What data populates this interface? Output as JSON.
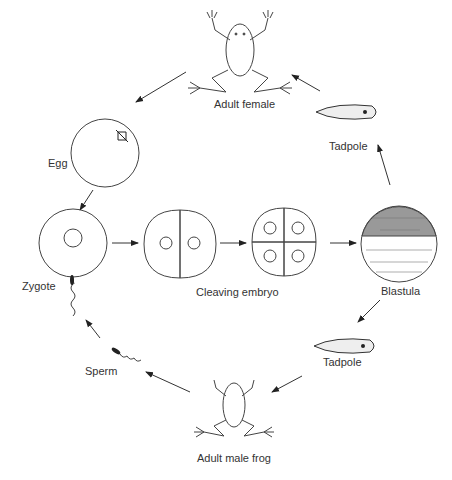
{
  "diagram": {
    "stages": {
      "adult_female": "Adult female",
      "tadpole_top": "Tadpole",
      "egg": "Egg",
      "zygote": "Zygote",
      "cleaving_embryo": "Cleaving embryo",
      "blastula": "Blastula",
      "tadpole_bottom": "Tadpole",
      "sperm": "Sperm",
      "adult_male": "Adult male frog"
    },
    "colors": {
      "line": "#333333",
      "background": "#ffffff"
    }
  }
}
